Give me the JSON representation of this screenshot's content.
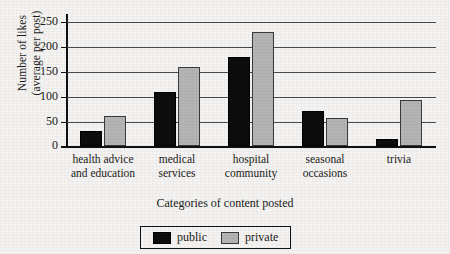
{
  "chart_data": {
    "type": "bar",
    "title": "",
    "xlabel": "Categories of content posted",
    "ylabel_line1": "Number of likes",
    "ylabel_line2": "(average per post)",
    "categories": [
      "health advice\nand education",
      "medical\nservices",
      "hospital\ncommunity",
      "seasonal\noccasions",
      "trivia"
    ],
    "category_lines": [
      [
        "health advice",
        "and education"
      ],
      [
        "medical",
        "services"
      ],
      [
        "hospital",
        "community"
      ],
      [
        "seasonal",
        "occasions"
      ],
      [
        "trivia",
        ""
      ]
    ],
    "series": [
      {
        "name": "public",
        "color": "#0d0d0d",
        "values": [
          30,
          110,
          180,
          72,
          14
        ]
      },
      {
        "name": "private",
        "color": "#b4b4b4",
        "values": [
          62,
          160,
          230,
          58,
          93
        ]
      }
    ],
    "ylim": [
      0,
      250
    ],
    "yticks": [
      0,
      50,
      100,
      150,
      200,
      250
    ],
    "ytick_labels": [
      "0",
      "50",
      "100",
      "150",
      "200",
      "250"
    ],
    "grid": true,
    "grid_axis": "y",
    "legend_position": "bottom-center"
  },
  "legend": {
    "items": [
      {
        "label": "public",
        "color": "#0d0d0d"
      },
      {
        "label": "private",
        "color": "#b4b4b4"
      }
    ]
  }
}
